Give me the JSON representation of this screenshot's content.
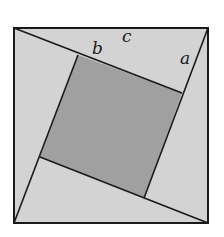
{
  "diagram": {
    "type": "pythagorean-proof-square",
    "labels": {
      "a": "a",
      "b": "b",
      "c": "c"
    },
    "colors": {
      "outer_triangles": "#d3d3d3",
      "inner_square": "#a0a0a0",
      "stroke": "#1a1a1a",
      "background": "#ffffff"
    }
  }
}
